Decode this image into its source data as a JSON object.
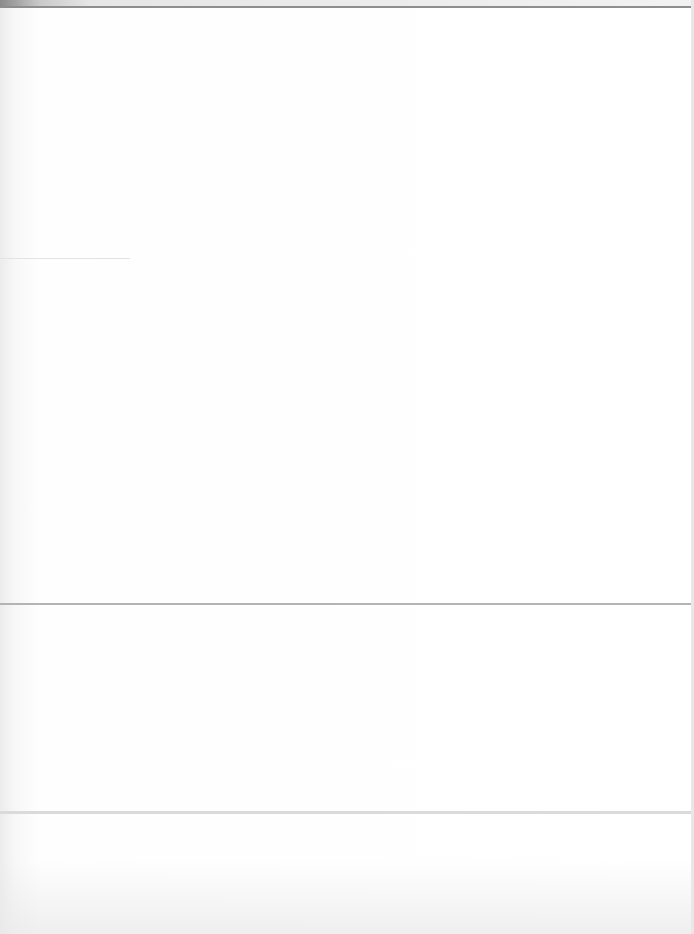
{
  "document": {
    "type": "scanned-page",
    "legible_text": [],
    "sections": [
      {
        "id": "section-1",
        "top": 8,
        "bottom": 258
      },
      {
        "id": "section-2",
        "top": 259,
        "bottom": 603
      },
      {
        "id": "section-3",
        "top": 605,
        "bottom": 811
      },
      {
        "id": "section-4",
        "top": 814,
        "bottom": 934
      }
    ],
    "colors": {
      "background": "#ffffff",
      "rule": "#b4b4b4",
      "top_band": "#8e8e8e"
    }
  }
}
